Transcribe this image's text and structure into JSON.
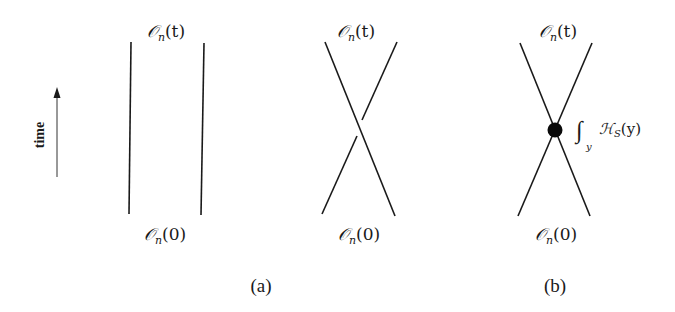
{
  "figure": {
    "time_axis": {
      "label": "time",
      "direction": "up"
    },
    "panels": [
      {
        "id": "a-left",
        "diagram": "two-parallel-lines",
        "top_label": {
          "script": "𝒪",
          "sub": "n",
          "arg": "(t)"
        },
        "bottom_label": {
          "script": "𝒪",
          "sub": "n",
          "arg": "(0)"
        }
      },
      {
        "id": "a-right",
        "diagram": "crossing-lines-over-under",
        "top_label": {
          "script": "𝒪",
          "sub": "n",
          "arg": "(t)"
        },
        "bottom_label": {
          "script": "𝒪",
          "sub": "n",
          "arg": "(0)"
        }
      },
      {
        "id": "b",
        "diagram": "crossing-lines-with-vertex",
        "top_label": {
          "script": "𝒪",
          "sub": "n",
          "arg": "(t)"
        },
        "bottom_label": {
          "script": "𝒪",
          "sub": "n",
          "arg": "(0)"
        },
        "vertex_label": {
          "integral": "∫",
          "integral_sub": "y",
          "script": "ℋ",
          "sub": "S",
          "arg": "(y)"
        }
      }
    ],
    "captions": {
      "a": "(a)",
      "b": "(b)"
    },
    "colors": {
      "ink": "#1a1a1a",
      "background": "#ffffff"
    }
  }
}
